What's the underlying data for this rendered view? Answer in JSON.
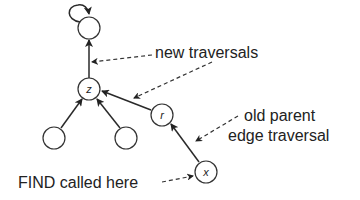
{
  "nodes": [
    {
      "id": "root",
      "label": ""
    },
    {
      "id": "z",
      "label": "z"
    },
    {
      "id": "left-child",
      "label": ""
    },
    {
      "id": "right-child",
      "label": ""
    },
    {
      "id": "r",
      "label": "r"
    },
    {
      "id": "x",
      "label": "x"
    }
  ],
  "edges": [
    {
      "from": "root",
      "to": "root",
      "kind": "self-loop"
    },
    {
      "from": "z",
      "to": "root"
    },
    {
      "from": "left-child",
      "to": "z"
    },
    {
      "from": "right-child",
      "to": "z"
    },
    {
      "from": "r",
      "to": "z"
    },
    {
      "from": "x",
      "to": "r"
    }
  ],
  "annotations": {
    "new_traversals": "new traversals",
    "old_parent_line1": "old parent",
    "old_parent_line2": "edge traversal",
    "find_called": "FIND called here"
  }
}
